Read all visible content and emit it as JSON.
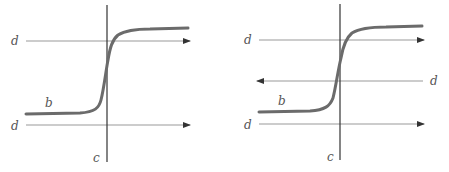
{
  "diagram": {
    "panels": [
      {
        "id": "left",
        "labels": {
          "top_arrow": "d",
          "bottom_arrow": "d",
          "curve": "b",
          "vertical_line": "c"
        },
        "arrows": [
          "right",
          "right"
        ]
      },
      {
        "id": "right",
        "labels": {
          "top_arrow": "d",
          "middle_arrow": "d",
          "bottom_arrow": "d",
          "curve": "b",
          "vertical_line": "c"
        },
        "arrows": [
          "right",
          "left",
          "right"
        ]
      }
    ],
    "colors": {
      "curve": "#6b6b6b",
      "axis": "#333333",
      "arrow": "#888888"
    }
  }
}
